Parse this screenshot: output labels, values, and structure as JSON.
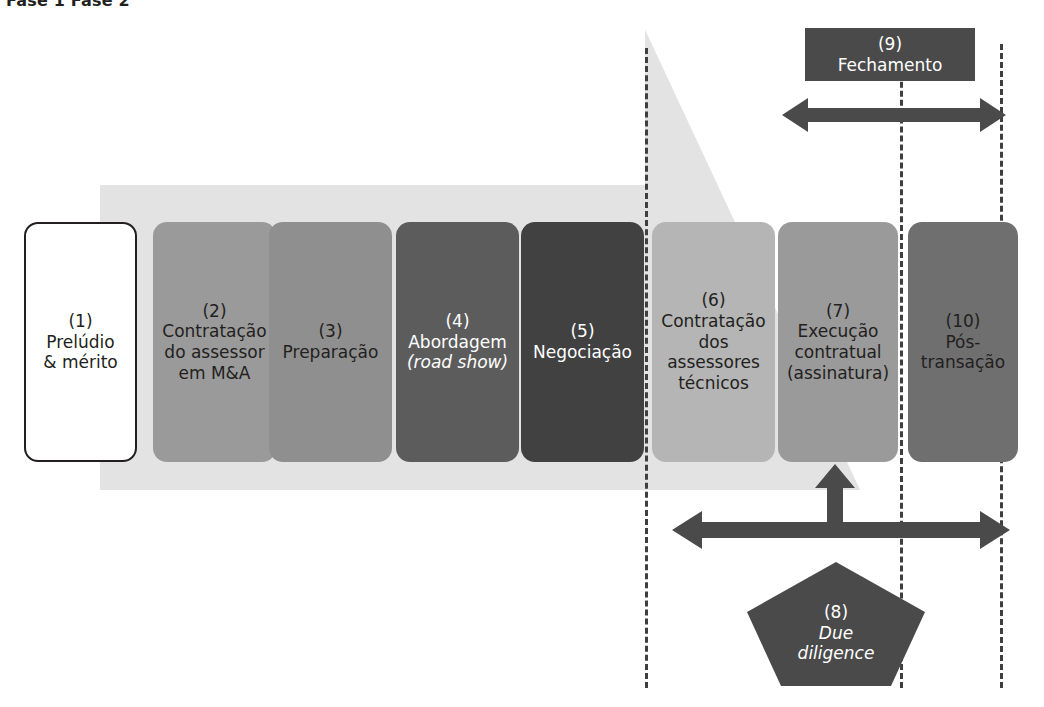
{
  "figure": {
    "top_caption": "Fase 1      Fase 2",
    "colors": {
      "band": "#e3e3e3",
      "dark": "#4a4a4a",
      "outline": "#231f20",
      "box2": "#9a9a9a",
      "box3": "#8f8f8f",
      "box4": "#5c5c5c",
      "box5": "#414141",
      "box6": "#b5b5b5",
      "box7": "#9a9a9a",
      "box10": "#6f6f6f",
      "box9": "#4a4a4a",
      "pentagon": "#4a4a4a"
    }
  },
  "phases": [
    {
      "num": "(1)",
      "label": "Prelúdio\n& mérito"
    },
    {
      "num": "(2)",
      "label": "Contratação\ndo assessor\nem  M&A"
    },
    {
      "num": "(3)",
      "label": "Preparação"
    },
    {
      "num": "(4)",
      "label": "Abordagem",
      "label_italic": "(road show)"
    },
    {
      "num": "(5)",
      "label": "Negociação"
    },
    {
      "num": "(6)",
      "label": "Contratação\ndos\nassessores\ntécnicos"
    },
    {
      "num": "(7)",
      "label": "Execução\ncontratual\n(assinatura)"
    },
    {
      "num": "(10)",
      "label": "Pós-\ntransação"
    }
  ],
  "closing": {
    "num": "(9)",
    "label": "Fechamento"
  },
  "diligence": {
    "num": "(8)",
    "label_italic": "Due\ndiligence"
  },
  "arrows": [
    {
      "name": "closing-span-arrow",
      "direction": "double-horizontal"
    },
    {
      "name": "diligence-span-arrow",
      "direction": "double-horizontal"
    },
    {
      "name": "diligence-up-arrow",
      "direction": "up"
    }
  ],
  "separators": [
    {
      "name": "separator-1"
    },
    {
      "name": "separator-2"
    },
    {
      "name": "separator-3"
    }
  ]
}
